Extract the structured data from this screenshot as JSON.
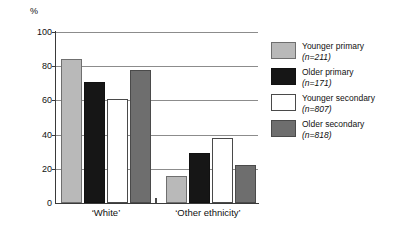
{
  "chart_data": {
    "type": "bar",
    "title": "",
    "xlabel": "",
    "ylabel": "%",
    "ylim": [
      0,
      100
    ],
    "yticks": [
      0,
      20,
      40,
      60,
      80,
      100
    ],
    "grid": true,
    "legend_position": "right",
    "categories": [
      "‘White’",
      "‘Other ethnicity’"
    ],
    "series": [
      {
        "name": "Younger primary",
        "n": 211,
        "n_label": "(n=211)",
        "color": "#b9b9b9",
        "values": [
          84,
          16
        ]
      },
      {
        "name": "Older primary",
        "n": 171,
        "n_label": "(n=171)",
        "color": "#161616",
        "values": [
          71,
          29
        ]
      },
      {
        "name": "Younger secondary",
        "n": 807,
        "n_label": "(n=807)",
        "color": "#ffffff",
        "values": [
          61,
          38
        ]
      },
      {
        "name": "Older secondary",
        "n": 818,
        "n_label": "(n=818)",
        "color": "#6e6e6e",
        "values": [
          78,
          22
        ]
      }
    ]
  },
  "axis": {
    "unit_label": "%",
    "tick_100": "100",
    "tick_80": "80",
    "tick_60": "60",
    "tick_40": "40",
    "tick_20": "20",
    "tick_0": "0"
  },
  "categories": {
    "cat_0": "‘White’",
    "cat_1": "‘Other ethnicity’"
  },
  "legend": {
    "items": [
      {
        "label": "Younger primary",
        "n_label": "(n=211)"
      },
      {
        "label": "Older primary",
        "n_label": "(n=171)"
      },
      {
        "label": "Younger secondary",
        "n_label": "(n=807)"
      },
      {
        "label": "Older secondary",
        "n_label": "(n=818)"
      }
    ]
  }
}
